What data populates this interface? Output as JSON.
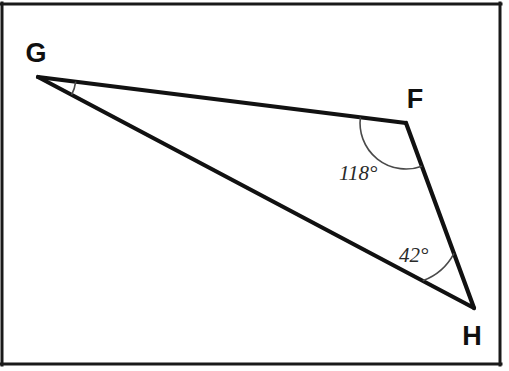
{
  "figure": {
    "type": "geometry-diagram",
    "shape": "triangle",
    "background_color": "#ffffff",
    "line_color": "#111111",
    "arc_color": "#4a4a4a",
    "frame": {
      "present": true,
      "color": "#1a1a1a",
      "stroke_width": 3,
      "top_y": 4,
      "right_x": 500,
      "bottom_y": 364,
      "left_x": 2
    },
    "vertices": [
      {
        "id": "G",
        "label": "G",
        "x": 38,
        "y": 77,
        "label_x": 36,
        "label_y": 62
      },
      {
        "id": "F",
        "label": "F",
        "x": 406,
        "y": 123,
        "label_x": 407,
        "label_y": 108
      },
      {
        "id": "H",
        "label": "H",
        "x": 474,
        "y": 308,
        "label_x": 459,
        "label_y": 345
      }
    ],
    "sides": [
      {
        "name": "GF",
        "from": "G",
        "to": "F"
      },
      {
        "name": "FH",
        "from": "F",
        "to": "H"
      },
      {
        "name": "HG",
        "from": "H",
        "to": "G"
      }
    ],
    "angles": [
      {
        "at": "G",
        "label": "",
        "value": null,
        "marked": true,
        "arc_radius": 38
      },
      {
        "at": "F",
        "label": "118°",
        "value": 118,
        "marked": true,
        "arc_radius": 46,
        "label_x": 339,
        "label_y": 180
      },
      {
        "at": "H",
        "label": "42°",
        "value": 42,
        "marked": true,
        "arc_radius": 58,
        "label_x": 399,
        "label_y": 262
      }
    ]
  }
}
